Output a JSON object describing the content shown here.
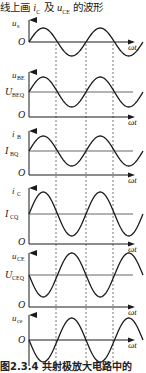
{
  "header": {
    "prefix": "线上画 ",
    "var1_main": "i",
    "var1_sub": "C",
    "middle": " 及 ",
    "var2_main": "u",
    "var2_sub": "CE",
    "suffix": " 的波形"
  },
  "caption": "图2.3.4  共射极放大电路中的",
  "colors": {
    "ink": "#1a1a1a",
    "dashed": "#555555",
    "ref_line": "#666666"
  },
  "x_axis_label": "ωt",
  "origin_label": "O",
  "axis": {
    "x0": 29,
    "x_end": 135,
    "period_px": 57,
    "cycles": 2,
    "dashed_x": [
      56,
      86,
      113
    ],
    "dashed_top": 44,
    "dashed_bottom": 362
  },
  "chart_data": {
    "type": "line",
    "xlabel": "ωt",
    "panels": [
      {
        "id": "us",
        "ylabel": "u",
        "ysub": "s",
        "dc_label": "",
        "dc_sub": "",
        "axis_top": 20,
        "baseline": 42,
        "dc_y": 42,
        "amplitude": 14,
        "invert": false,
        "origin_y": 42,
        "origin_on_baseline": true
      },
      {
        "id": "ube",
        "ylabel": "u",
        "ysub": "BE",
        "dc_label": "U",
        "dc_sub": "BEQ",
        "axis_top": 72,
        "baseline": 117,
        "dc_y": 92,
        "amplitude": 15,
        "invert": false,
        "origin_y": 117,
        "origin_on_baseline": false
      },
      {
        "id": "ib",
        "ylabel": "i",
        "ysub": "B",
        "dc_label": "I",
        "dc_sub": "BQ",
        "axis_top": 131,
        "baseline": 175,
        "dc_y": 151,
        "amplitude": 15,
        "invert": false,
        "origin_y": 175,
        "origin_on_baseline": false
      },
      {
        "id": "ic",
        "ylabel": "i",
        "ysub": "C",
        "dc_label": "I",
        "dc_sub": "CQ",
        "axis_top": 188,
        "baseline": 244,
        "dc_y": 214,
        "amplitude": 22,
        "invert": false,
        "origin_y": 244,
        "origin_on_baseline": false
      },
      {
        "id": "uce",
        "ylabel": "u",
        "ysub": "CE",
        "dc_label": "U",
        "dc_sub": "CEQ",
        "axis_top": 253,
        "baseline": 307,
        "dc_y": 275,
        "amplitude": 22,
        "invert": true,
        "origin_y": 307,
        "origin_on_baseline": false
      },
      {
        "id": "uo",
        "ylabel": "u",
        "ysub": "ce",
        "dc_label": "",
        "dc_sub": "",
        "axis_top": 315,
        "baseline": 340,
        "dc_y": 340,
        "amplitude": 22,
        "invert": true,
        "origin_y": 340,
        "origin_on_baseline": true
      }
    ]
  }
}
